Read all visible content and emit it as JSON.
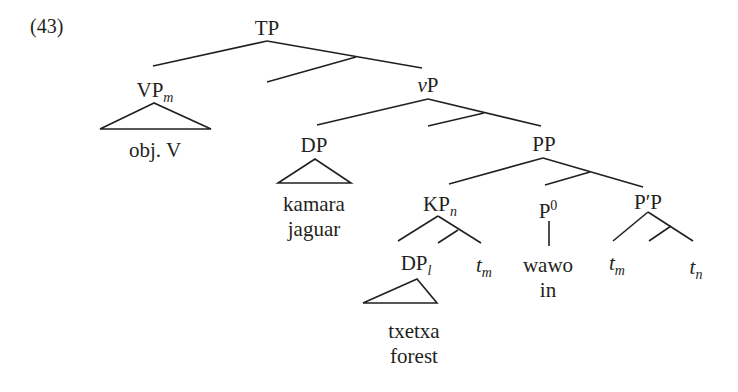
{
  "example_number": "(43)",
  "nodes": {
    "tp": {
      "label": "TP"
    },
    "vpm": {
      "label": "VP",
      "sub": "m",
      "terminal": "obj. V"
    },
    "vp_little": {
      "label_italic": "v",
      "label": "P"
    },
    "dp": {
      "label": "DP",
      "terminal_line1": "kamara",
      "terminal_line2": "jaguar"
    },
    "pp": {
      "label": "PP"
    },
    "kpn": {
      "label": "KP",
      "sub": "n"
    },
    "dpl": {
      "label": "DP",
      "sub": "l",
      "terminal_line1": "txetxa",
      "terminal_line2": "forest"
    },
    "trace_m_kp": {
      "label": "t",
      "sub": "m"
    },
    "p0": {
      "label": "P",
      "sup": "0",
      "terminal_line1": "wawo",
      "terminal_line2": "in"
    },
    "ppp": {
      "label": "P′P"
    },
    "trace_m_pp": {
      "label": "t",
      "sub": "m"
    },
    "trace_n": {
      "label": "t",
      "sub": "n"
    }
  }
}
